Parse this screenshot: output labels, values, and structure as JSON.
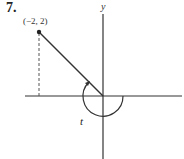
{
  "problem": {
    "number": "7."
  },
  "diagram": {
    "point": {
      "label": "(−2, 2)",
      "x": -2,
      "y": 2
    },
    "axes": {
      "x_label": "",
      "y_label": "y"
    },
    "angle": {
      "label": "t",
      "direction": "clockwise",
      "terminal_side_quadrant": "II"
    },
    "colors": {
      "stroke": "#333333",
      "background": "#ffffff"
    }
  }
}
